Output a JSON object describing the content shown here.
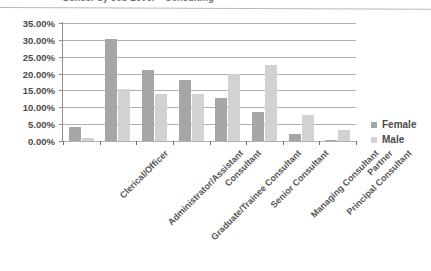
{
  "title": {
    "text": "Gender by Job Level – Consulting",
    "visible_partial": true
  },
  "legend": {
    "position": "right",
    "entries": [
      {
        "label": "Female",
        "color": "#a6a6a6",
        "icon": "legend-swatch-icon"
      },
      {
        "label": "Male",
        "color": "#d2d2d2",
        "icon": "legend-swatch-icon"
      }
    ]
  },
  "axis": {
    "y_ticks": [
      "0.00%",
      "5.00%",
      "10.00%",
      "15.00%",
      "20.00%",
      "25.00%",
      "30.00%",
      "35.00%"
    ]
  },
  "chart_data": {
    "type": "bar",
    "title": "Gender by Job Level – Consulting",
    "xlabel": "",
    "ylabel": "",
    "ylim": [
      0,
      35
    ],
    "ytick_step": 5,
    "ytick_format": "percent",
    "grid": true,
    "legend_position": "right",
    "categories": [
      "Clerical/Officer",
      "Administrator/Assistant",
      "Graduate/Trainee Consultant",
      "Consultant",
      "Senior Consultant",
      "Managing Consultant",
      "Principal Consultant",
      "Partner"
    ],
    "series": [
      {
        "name": "Female",
        "color": "#a6a6a6",
        "values": [
          4.1,
          30.2,
          21.2,
          18.2,
          12.9,
          8.7,
          2.2,
          0.3
        ]
      },
      {
        "name": "Male",
        "color": "#d2d2d2",
        "values": [
          1.0,
          15.5,
          13.8,
          13.8,
          19.8,
          22.5,
          7.7,
          3.3
        ]
      }
    ]
  }
}
